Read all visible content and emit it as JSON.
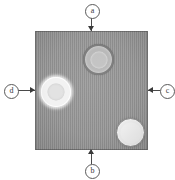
{
  "figure": {
    "background_color": "#ffffff",
    "specimen": {
      "name": "specimen-square",
      "fill_color": "#949494",
      "texture": "vertical-striations",
      "x": 35,
      "y": 31,
      "width": 113,
      "height": 119
    },
    "features": [
      {
        "id": "top",
        "name": "circular-feature-top",
        "description": "ring-rimmed circular feature",
        "rim_color": "#7c7c7c",
        "fill_color": "#b8b8b8",
        "x": 48,
        "y": 13,
        "diameter": 27
      },
      {
        "id": "left",
        "name": "circular-feature-left",
        "description": "bright halo circular feature",
        "rim_color": "#f2f2f2",
        "fill_color": "#e2e2e2",
        "x": 6,
        "y": 46,
        "diameter": 30
      },
      {
        "id": "bottom-right",
        "name": "circular-feature-bottom-right",
        "description": "light circular feature with grey rim",
        "rim_color": "#8a8a8a",
        "fill_color": "#ececec",
        "x": 81,
        "y": 87,
        "diameter": 27
      }
    ],
    "labels": [
      {
        "id": "top",
        "text": "a",
        "position": "top",
        "points_to": "top edge of specimen"
      },
      {
        "id": "left",
        "text": "d",
        "position": "left",
        "points_to": "left edge of specimen"
      },
      {
        "id": "right",
        "text": "c",
        "position": "right",
        "points_to": "right edge of specimen"
      },
      {
        "id": "bottom",
        "text": "b",
        "position": "bottom",
        "points_to": "bottom edge of specimen"
      }
    ],
    "annotation_color": "#3a3a3a"
  }
}
